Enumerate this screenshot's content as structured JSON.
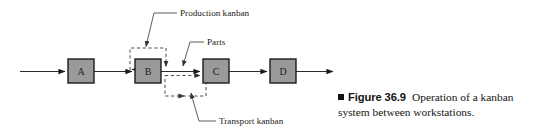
{
  "figure": {
    "caption_marker": "square-bullet",
    "figure_number": "Figure 36.9",
    "caption_line1": "Operation of a kanban",
    "caption_line2": "system between workstations."
  },
  "diagram": {
    "title": "Operation of a kanban system between workstations",
    "stations": [
      {
        "id": "A",
        "label": "A",
        "x": 68,
        "y": 59,
        "w": 26,
        "h": 24
      },
      {
        "id": "B",
        "label": "B",
        "x": 135,
        "y": 59,
        "w": 26,
        "h": 24
      },
      {
        "id": "C",
        "label": "C",
        "x": 203,
        "y": 59,
        "w": 26,
        "h": 24
      },
      {
        "id": "D",
        "label": "D",
        "x": 270,
        "y": 59,
        "w": 26,
        "h": 24
      }
    ],
    "annotations": [
      {
        "id": "production-kanban",
        "label": "Production kanban",
        "text_x": 180,
        "text_y": 14
      },
      {
        "id": "parts",
        "label": "Parts",
        "text_x": 207,
        "text_y": 43
      },
      {
        "id": "transport-kanban",
        "label": "Transport kanban",
        "text_x": 219,
        "text_y": 122
      }
    ],
    "loops": [
      {
        "id": "production-kanban-loop",
        "x": 130,
        "y": 48,
        "w": 36,
        "h": 23
      },
      {
        "id": "transport-kanban-loop",
        "x": 165,
        "y": 73,
        "w": 41,
        "h": 23
      }
    ],
    "colors": {
      "station_fill": "#9a9a9a",
      "station_stroke": "#1c1c1c",
      "loop_stroke": "#4a4a4a",
      "flow_stroke": "#2b2b2b",
      "background": "#ffffff"
    }
  }
}
